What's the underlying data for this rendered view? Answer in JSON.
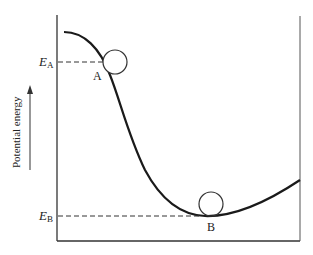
{
  "diagram": {
    "type": "potential-energy-curve",
    "y_axis_label": "Potential energy",
    "y_axis_arrow": "up-arrow",
    "levels": [
      {
        "name": "E",
        "subscript": "A",
        "point_label": "A"
      },
      {
        "name": "E",
        "subscript": "B",
        "point_label": "B"
      }
    ],
    "balls": [
      "ball-at-A",
      "ball-at-B"
    ],
    "colors": {
      "line": "#1a1a1a",
      "frame": "#333333",
      "background": "#ffffff"
    }
  }
}
